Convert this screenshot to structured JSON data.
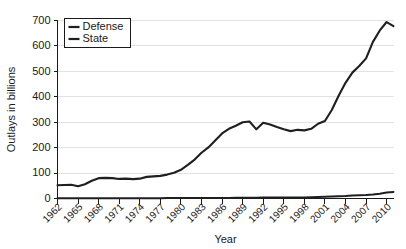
{
  "chart_data": {
    "type": "line",
    "title": "",
    "xlabel": "Year",
    "ylabel": "Outlays in billions",
    "xlim": [
      1962,
      2011
    ],
    "ylim": [
      0,
      700
    ],
    "ytick_step": 100,
    "grid": true,
    "legend_position": "top-left",
    "ytick_labels": [
      "0",
      "100",
      "200",
      "300",
      "400",
      "500",
      "600",
      "700"
    ],
    "ytick_values": [
      0,
      100,
      200,
      300,
      400,
      500,
      600,
      700
    ],
    "xtick_labels": [
      "1962",
      "1965",
      "1968",
      "1971",
      "1974",
      "1977",
      "1980",
      "1983",
      "1986",
      "1989",
      "1992",
      "1995",
      "1998",
      "2001",
      "2004",
      "2007",
      "2010"
    ],
    "xtick_values": [
      1962,
      1965,
      1968,
      1971,
      1974,
      1977,
      1980,
      1983,
      1986,
      1989,
      1992,
      1995,
      1998,
      2001,
      2004,
      2007,
      2010
    ],
    "x": [
      1962,
      1963,
      1964,
      1965,
      1966,
      1967,
      1968,
      1969,
      1970,
      1971,
      1972,
      1973,
      1974,
      1975,
      1976,
      1977,
      1978,
      1979,
      1980,
      1981,
      1982,
      1983,
      1984,
      1985,
      1986,
      1987,
      1988,
      1989,
      1990,
      1991,
      1992,
      1993,
      1994,
      1995,
      1996,
      1997,
      1998,
      1999,
      2000,
      2001,
      2002,
      2003,
      2004,
      2005,
      2006,
      2007,
      2008,
      2009,
      2010,
      2011
    ],
    "series": [
      {
        "name": "Defense",
        "color": "#1f1f1f",
        "values": [
          52,
          53,
          54,
          48,
          56,
          70,
          80,
          81,
          80,
          77,
          78,
          76,
          78,
          85,
          87,
          89,
          94,
          101,
          113,
          132,
          153,
          180,
          201,
          228,
          256,
          274,
          286,
          300,
          303,
          272,
          298,
          291,
          281,
          272,
          265,
          270,
          268,
          274,
          294,
          305,
          348,
          404,
          455,
          495,
          521,
          551,
          616,
          661,
          694,
          678
        ]
      },
      {
        "name": "State",
        "color": "#1f1f1f",
        "values": [
          1,
          1,
          1,
          1,
          1,
          1,
          1,
          1,
          1,
          1,
          1,
          1,
          1,
          1,
          1,
          1,
          2,
          2,
          2,
          2,
          2,
          2,
          2,
          2,
          2,
          2,
          3,
          3,
          3,
          3,
          4,
          4,
          4,
          4,
          4,
          4,
          4,
          5,
          6,
          7,
          8,
          9,
          10,
          12,
          13,
          14,
          16,
          19,
          24,
          26
        ]
      }
    ]
  },
  "legend": {
    "entries": [
      {
        "label": "Defense"
      },
      {
        "label": "State"
      }
    ]
  },
  "axes": {
    "y_title": "Outlays in billions",
    "x_title": "Year"
  }
}
